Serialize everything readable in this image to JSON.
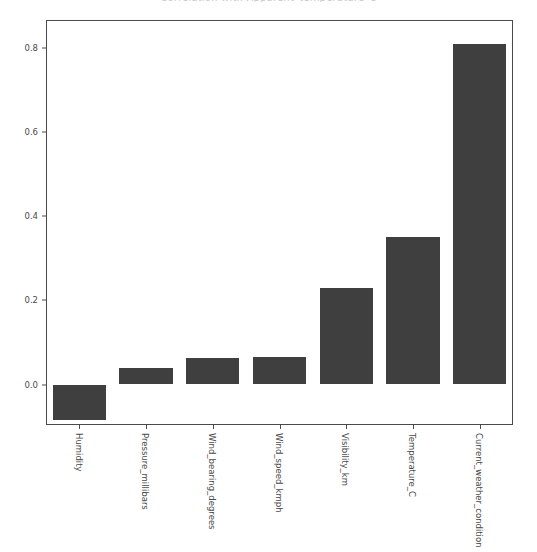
{
  "chart_data": {
    "type": "bar",
    "title": "Correlation with Apparent_temperature_C",
    "categories": [
      "Humidity",
      "Pressure_millibars",
      "Wind_bearing_degrees",
      "Wind_speed_kmph",
      "Visibility_km",
      "Temperature_C",
      "Current_weather_condition"
    ],
    "values": [
      -0.085,
      0.04,
      0.062,
      0.066,
      0.23,
      0.35,
      0.81
    ],
    "xlabel": "",
    "ylabel": "",
    "ylim": [
      -0.0963,
      0.8667
    ],
    "yticks": [
      0.0,
      0.2,
      0.4,
      0.6,
      0.8
    ],
    "ytick_labels": [
      "0.0",
      "0.2",
      "0.4",
      "0.6",
      "0.8"
    ],
    "grid": false,
    "legend": null,
    "bar_color": "#3f3f3f",
    "axis_color": "#4a4a4a",
    "background": "#ffffff"
  }
}
